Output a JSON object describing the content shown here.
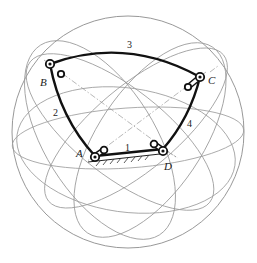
{
  "diagram": {
    "type": "spherical four-bar linkage",
    "sphere": {
      "cx": 128,
      "cy": 132,
      "r": 116
    },
    "colors": {
      "link": "#111111",
      "grid": "#9a9a9a",
      "background": "#ffffff"
    },
    "joints": [
      {
        "id": "A",
        "label": "A",
        "x": 95,
        "y": 156,
        "grounded": true
      },
      {
        "id": "B",
        "label": "B",
        "x": 50,
        "y": 64,
        "grounded": false
      },
      {
        "id": "C",
        "label": "C",
        "x": 200,
        "y": 77,
        "grounded": false
      },
      {
        "id": "D",
        "label": "D",
        "x": 163,
        "y": 149,
        "grounded": true
      }
    ],
    "links": [
      {
        "id": "1",
        "label": "1",
        "from": "A",
        "to": "D",
        "role": "ground"
      },
      {
        "id": "2",
        "label": "2",
        "from": "A",
        "to": "B",
        "role": "crank"
      },
      {
        "id": "3",
        "label": "3",
        "from": "B",
        "to": "C",
        "role": "coupler"
      },
      {
        "id": "4",
        "label": "4",
        "from": "C",
        "to": "D",
        "role": "rocker"
      }
    ]
  },
  "labels": {
    "joint_A": "A",
    "joint_B": "B",
    "joint_C": "C",
    "joint_D": "D",
    "link_1": "1",
    "link_2": "2",
    "link_3": "3",
    "link_4": "4"
  }
}
